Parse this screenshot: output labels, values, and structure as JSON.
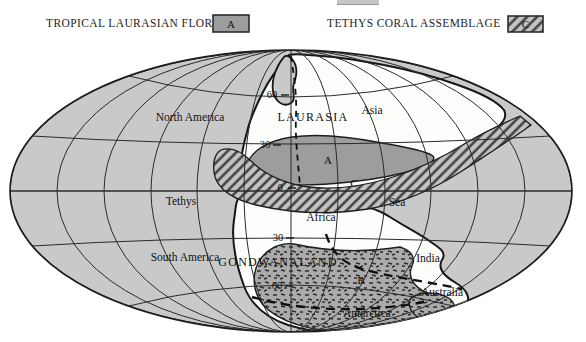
{
  "legend": {
    "flora": {
      "label": "TROPICAL LAURASIAN FLORA",
      "key": "A"
    },
    "coral": {
      "label": "TETHYS CORAL ASSEMBLAGE",
      "key": "C"
    }
  },
  "map": {
    "labels": {
      "north_america": "North America",
      "laurasia": "LAURASIA",
      "asia": "Asia",
      "tethys": "Tethys",
      "sea": "Sea",
      "africa": "Africa",
      "south_america": "South America",
      "gondwanaland": "GONDWANALAND",
      "india": "India",
      "australia": "Australia",
      "antarctica": "Antarctica"
    },
    "zones": {
      "a": "A",
      "b": "B",
      "c": "C"
    },
    "latitudes": {
      "n60": "60",
      "n30": "30",
      "equator": "0",
      "s30": "30",
      "s60": "60"
    },
    "colors": {
      "ocean": "#c9c9c9",
      "land": "#fdfdfc",
      "flora_a": "#9d9d9d",
      "hatch_bg": "#c3c3c3",
      "hatch_line": "#3b3b3b",
      "stipple_bg": "#ababab",
      "stipple_mark": "#2e2e2e",
      "line": "#1e1e1e"
    }
  }
}
